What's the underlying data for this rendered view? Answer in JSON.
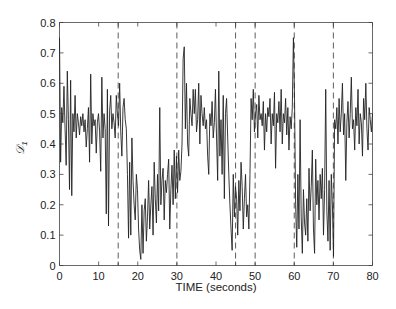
{
  "chart_data": {
    "type": "line",
    "title": "",
    "xlabel": "TIME (seconds)",
    "ylabel": "D1",
    "ylabel_display": "𝒟",
    "ylabel_subscript": "1",
    "xlim": [
      0,
      80
    ],
    "ylim": [
      0,
      0.8
    ],
    "x_ticks": [
      0,
      10,
      20,
      30,
      40,
      50,
      60,
      70,
      80
    ],
    "x_minor_ticks": [
      15,
      45
    ],
    "y_ticks": [
      0,
      0.1,
      0.2,
      0.3,
      0.4,
      0.5,
      0.6,
      0.7,
      0.8
    ],
    "y_tick_labels": [
      "0",
      "0.1",
      "0.2",
      "0.3",
      "0.4",
      "0.5",
      "0.6",
      "0.7",
      "0.8"
    ],
    "x_tick_labels": [
      "0",
      "10",
      "20",
      "30",
      "40",
      "50",
      "60",
      "70",
      "80"
    ],
    "grid": false,
    "legend": null,
    "vertical_dashed_lines": [
      15,
      30,
      45,
      50,
      60,
      70
    ],
    "line_color": "#222222",
    "series": [
      {
        "name": "D1",
        "x_step": 0.5,
        "x_start": 0,
        "values": [
          0.75,
          0.34,
          0.52,
          0.47,
          0.59,
          0.45,
          0.33,
          0.64,
          0.48,
          0.25,
          0.61,
          0.23,
          0.5,
          0.44,
          0.56,
          0.42,
          0.5,
          0.47,
          0.43,
          0.49,
          0.46,
          0.5,
          0.44,
          0.48,
          0.39,
          0.45,
          0.52,
          0.34,
          0.63,
          0.4,
          0.5,
          0.46,
          0.48,
          0.37,
          0.47,
          0.5,
          0.44,
          0.31,
          0.62,
          0.42,
          0.5,
          0.45,
          0.17,
          0.58,
          0.13,
          0.51,
          0.56,
          0.45,
          0.5,
          0.47,
          0.42,
          0.56,
          0.5,
          0.46,
          0.6,
          0.44,
          0.36,
          0.52,
          0.55,
          0.48,
          0.45,
          0.3,
          0.09,
          0.34,
          0.1,
          0.42,
          0.28,
          0.2,
          0.15,
          0.3,
          0.25,
          0.12,
          0.05,
          0.02,
          0.2,
          0.04,
          0.18,
          0.22,
          0.08,
          0.16,
          0.28,
          0.12,
          0.2,
          0.26,
          0.1,
          0.34,
          0.22,
          0.14,
          0.3,
          0.18,
          0.52,
          0.2,
          0.28,
          0.32,
          0.15,
          0.28,
          0.24,
          0.3,
          0.35,
          0.12,
          0.25,
          0.33,
          0.2,
          0.38,
          0.22,
          0.36,
          0.24,
          0.38,
          0.28,
          0.31,
          0.4,
          0.68,
          0.72,
          0.45,
          0.6,
          0.4,
          0.36,
          0.55,
          0.5,
          0.46,
          0.58,
          0.5,
          0.58,
          0.44,
          0.48,
          0.6,
          0.4,
          0.56,
          0.5,
          0.46,
          0.52,
          0.45,
          0.48,
          0.36,
          0.3,
          0.5,
          0.46,
          0.54,
          0.42,
          0.47,
          0.58,
          0.42,
          0.28,
          0.64,
          0.36,
          0.48,
          0.3,
          0.56,
          0.22,
          0.5,
          0.55,
          0.42,
          0.3,
          0.2,
          0.12,
          0.05,
          0.3,
          0.16,
          0.26,
          0.22,
          0.1,
          0.28,
          0.18,
          0.34,
          0.26,
          0.12,
          0.22,
          0.3,
          0.16,
          0.2,
          0.12,
          0.3,
          0.55,
          0.48,
          0.58,
          0.44,
          0.5,
          0.53,
          0.42,
          0.56,
          0.48,
          0.5,
          0.46,
          0.54,
          0.38,
          0.5,
          0.44,
          0.52,
          0.49,
          0.55,
          0.4,
          0.5,
          0.46,
          0.57,
          0.32,
          0.5,
          0.47,
          0.54,
          0.44,
          0.58,
          0.4,
          0.5,
          0.47,
          0.55,
          0.43,
          0.52,
          0.38,
          0.49,
          0.45,
          0.52,
          0.75,
          0.55,
          0.2,
          0.06,
          0.3,
          0.12,
          0.48,
          0.16,
          0.04,
          0.25,
          0.14,
          0.1,
          0.22,
          0.08,
          0.32,
          0.18,
          0.26,
          0.38,
          0.12,
          0.04,
          0.35,
          0.2,
          0.28,
          0.15,
          0.3,
          0.22,
          0.32,
          0.1,
          0.25,
          0.58,
          0.18,
          0.08,
          0.28,
          0.05,
          0.3,
          0.2,
          0.03,
          0.48,
          0.45,
          0.52,
          0.4,
          0.55,
          0.44,
          0.5,
          0.6,
          0.43,
          0.5,
          0.28,
          0.47,
          0.54,
          0.42,
          0.5,
          0.62,
          0.45,
          0.48,
          0.38,
          0.52,
          0.46,
          0.58,
          0.4,
          0.5,
          0.47,
          0.36,
          0.55,
          0.48,
          0.6,
          0.45,
          0.38,
          0.52,
          0.48,
          0.44,
          0.5
        ]
      }
    ]
  }
}
